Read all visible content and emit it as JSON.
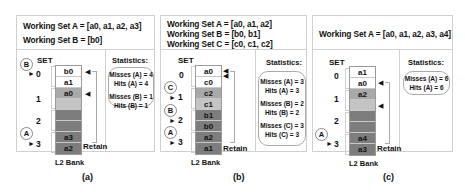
{
  "colors": {
    "white": "#ffffff",
    "light_gray": "#c4c4c4",
    "medium_gray": "#a9a9a9",
    "dark_gray": "#7d7d7d",
    "border": "#cfcfcf"
  },
  "panels": [
    {
      "caption": "(a)",
      "working_sets": [
        "Working Set A = [a0, a1, a2, a3]",
        "Working Set B = [b0]"
      ],
      "set_label": "SET",
      "set_numbers": [
        "0",
        "1",
        "2",
        "3"
      ],
      "markers": [
        {
          "label": "B",
          "points_to": "0"
        },
        {
          "label": "A",
          "points_to": "3"
        }
      ],
      "bank_label": "L2 Bank",
      "retain_label": "Retain",
      "cells": [
        {
          "label": "b0",
          "shade": "white"
        },
        {
          "label": "a1",
          "shade": "white"
        },
        {
          "label": "a0",
          "shade": "medium_gray"
        },
        {
          "label": "",
          "shade": "light_gray"
        },
        {
          "label": "",
          "shade": "dark_gray"
        },
        {
          "label": "",
          "shade": "dark_gray"
        },
        {
          "label": "a3",
          "shade": "dark_gray"
        },
        {
          "label": "a2",
          "shade": "dark_gray"
        }
      ],
      "stats_title": "Statistics:",
      "stats": [
        [
          "Misses (A) = 4",
          "Hits (A) = 4"
        ],
        [
          "Misses (B) = 1",
          "Hits (B) = 1"
        ]
      ]
    },
    {
      "caption": "(b)",
      "working_sets": [
        "Working Set A = [a0, a1, a2]",
        "Working Set B = [b0, b1]",
        "Working Set C = [c0, c1, c2]"
      ],
      "set_label": "SET",
      "set_numbers": [
        "0",
        "1",
        "2",
        "3"
      ],
      "markers": [
        {
          "label": "C",
          "points_to": "1"
        },
        {
          "label": "B",
          "points_to": "2"
        },
        {
          "label": "A",
          "points_to": "3"
        }
      ],
      "bank_label": "L2 Bank",
      "retain_label": "Retain",
      "cells": [
        {
          "label": "a0",
          "shade": "white"
        },
        {
          "label": "c0",
          "shade": "white"
        },
        {
          "label": "c2",
          "shade": "medium_gray"
        },
        {
          "label": "c1",
          "shade": "light_gray"
        },
        {
          "label": "b1",
          "shade": "dark_gray"
        },
        {
          "label": "b0",
          "shade": "dark_gray"
        },
        {
          "label": "a2",
          "shade": "dark_gray"
        },
        {
          "label": "a1",
          "shade": "dark_gray"
        }
      ],
      "stats_title": "Statistics:",
      "stats": [
        [
          "Misses (A) = 3",
          "Hits (A) = 3"
        ],
        [
          "Misses (B) = 2",
          "Hits (B) = 2"
        ],
        [
          "Misses (C) = 3",
          "Hits (C) = 3"
        ]
      ]
    },
    {
      "caption": "(c)",
      "working_sets": [
        "Working Set A = [a0, a1, a2, a3, a4]"
      ],
      "set_label": "SET",
      "set_numbers": [
        "0",
        "1",
        "2",
        "3"
      ],
      "markers": [
        {
          "label": "A",
          "points_to": "3"
        }
      ],
      "bank_label": "L2 Bank",
      "retain_label": "Retain",
      "cells": [
        {
          "label": "a1",
          "shade": "white"
        },
        {
          "label": "a0",
          "shade": "white"
        },
        {
          "label": "a2",
          "shade": "medium_gray"
        },
        {
          "label": "",
          "shade": "light_gray"
        },
        {
          "label": "",
          "shade": "dark_gray"
        },
        {
          "label": "",
          "shade": "dark_gray"
        },
        {
          "label": "a4",
          "shade": "dark_gray"
        },
        {
          "label": "a3",
          "shade": "dark_gray"
        }
      ],
      "stats_title": "Statistics:",
      "stats": [
        [
          "Misses (A) = 6",
          "Hits (A) = 6"
        ]
      ]
    }
  ]
}
